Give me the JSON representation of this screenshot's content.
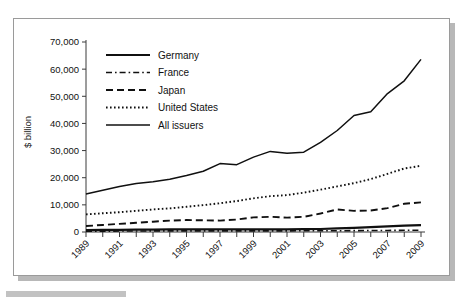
{
  "chart_data": {
    "type": "line",
    "title": "",
    "xlabel": "",
    "ylabel": "$ billion",
    "ylim": [
      0,
      70000
    ],
    "xlim": [
      1989,
      2009
    ],
    "grid": false,
    "legend_position": "top-left",
    "y_ticks": [
      "0",
      "10,000",
      "20,000",
      "30,000",
      "40,000",
      "50,000",
      "60,000",
      "70,000"
    ],
    "y_tick_values": [
      0,
      10000,
      20000,
      30000,
      40000,
      50000,
      60000,
      70000
    ],
    "x_tick_labels": [
      "1989",
      "1991",
      "1993",
      "1995",
      "1997",
      "1999",
      "2001",
      "2003",
      "2005",
      "2007",
      "2009"
    ],
    "x": [
      1989,
      1990,
      1991,
      1992,
      1993,
      1994,
      1995,
      1996,
      1997,
      1998,
      1999,
      2000,
      2001,
      2002,
      2003,
      2004,
      2005,
      2006,
      2007,
      2008,
      2009
    ],
    "series": [
      {
        "name": "Germany",
        "style": "solid-thick",
        "values": [
          700,
          750,
          800,
          850,
          900,
          950,
          1000,
          1000,
          1000,
          1000,
          1000,
          1000,
          1000,
          1050,
          1100,
          1300,
          1500,
          1800,
          2100,
          2350,
          2550
        ]
      },
      {
        "name": "France",
        "style": "dash-dot",
        "values": [
          300,
          320,
          350,
          380,
          400,
          420,
          430,
          430,
          430,
          430,
          430,
          430,
          430,
          440,
          450,
          470,
          500,
          540,
          580,
          620,
          650
        ]
      },
      {
        "name": "Japan",
        "style": "dashed",
        "values": [
          2200,
          2600,
          3000,
          3400,
          3800,
          4200,
          4400,
          4300,
          4200,
          4600,
          5400,
          5600,
          5300,
          5600,
          6800,
          8300,
          7800,
          7900,
          8800,
          10400,
          10900
        ]
      },
      {
        "name": "United States",
        "style": "dotted",
        "values": [
          6500,
          6900,
          7300,
          7800,
          8300,
          8700,
          9300,
          9900,
          10600,
          11400,
          12400,
          13200,
          13600,
          14500,
          15600,
          16800,
          18000,
          19500,
          21400,
          23400,
          24400
        ]
      },
      {
        "name": "All issuers",
        "style": "solid",
        "values": [
          14000,
          15400,
          16800,
          17900,
          18500,
          19400,
          20800,
          22400,
          25200,
          24800,
          27600,
          29700,
          29000,
          29400,
          33000,
          37400,
          42900,
          44300,
          51000,
          55700,
          63600
        ]
      }
    ]
  }
}
